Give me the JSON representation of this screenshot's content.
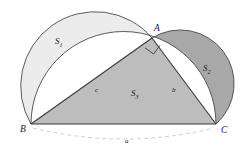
{
  "figure": {
    "vertices": [
      {
        "name": "A",
        "label": "A",
        "x": 152,
        "y": 38,
        "label_x": 154,
        "label_y": 31
      },
      {
        "name": "B",
        "label": "B",
        "x": 31,
        "y": 124,
        "label_x": 20,
        "label_y": 132
      },
      {
        "name": "C",
        "label": "C",
        "x": 216,
        "y": 124,
        "label_x": 221,
        "label_y": 133
      }
    ],
    "areas": [
      {
        "name": "S1",
        "base": "S",
        "sub": "1",
        "x": 55,
        "y": 44,
        "fill": "#ececec",
        "role": "left-lune"
      },
      {
        "name": "S2",
        "base": "S",
        "sub": "2",
        "x": 203,
        "y": 71,
        "fill": "#a8a8a8",
        "role": "right-lune"
      },
      {
        "name": "S3",
        "base": "S",
        "sub": "3",
        "x": 131,
        "y": 96,
        "fill": "#bdbdbd",
        "role": "triangle"
      }
    ],
    "sides": [
      {
        "name": "c",
        "label": "c",
        "x": 95,
        "y": 92,
        "between": "B-A"
      },
      {
        "name": "b",
        "label": "b",
        "x": 172,
        "y": 92,
        "between": "A-C"
      },
      {
        "name": "a",
        "label": "a",
        "x": 125,
        "y": 143,
        "between": "B-C"
      }
    ],
    "right_angle": {
      "at": "A",
      "size": 11
    },
    "colors": {
      "stroke": "#4a4a4a",
      "triangle_fill": "#bdbdbd",
      "lune_left_fill": "#ececec",
      "lune_right_fill": "#a8a8a8",
      "background": "#ffffff",
      "dashed_arc": "#c9c9c9",
      "label_color": "#1a1a1a"
    },
    "dashed_arc": {
      "from": "B",
      "to": "C",
      "label": "a"
    }
  }
}
